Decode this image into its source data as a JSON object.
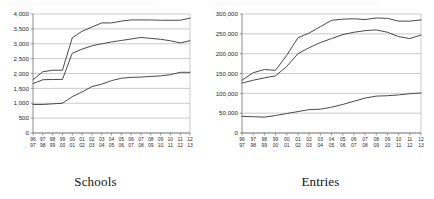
{
  "figure": {
    "panels": [
      {
        "caption": "Schools"
      },
      {
        "caption": "Entries"
      }
    ]
  },
  "chart_data": [
    {
      "type": "line",
      "title": "Schools",
      "xlabel": "",
      "ylabel": "",
      "grid": true,
      "legend": "none",
      "ylim": [
        0,
        4000
      ],
      "yticks": [
        0,
        500,
        1000,
        1500,
        2000,
        2500,
        3000,
        3500,
        4000
      ],
      "ytick_labels": [
        "0",
        "500",
        "1,000",
        "1,500",
        "2,000",
        "2,500",
        "3,000",
        "3,500",
        "4,000"
      ],
      "categories": [
        "96/97",
        "97/98",
        "98/99",
        "99/00",
        "00/01",
        "01/02",
        "02/03",
        "03/04",
        "04/05",
        "05/06",
        "06/07",
        "07/08",
        "08/09",
        "09/10",
        "10/11",
        "11/12",
        "12/13"
      ],
      "series": [
        {
          "name": "Top series",
          "values": [
            1790,
            2060,
            2110,
            2110,
            3200,
            3420,
            3560,
            3700,
            3700,
            3760,
            3800,
            3800,
            3800,
            3790,
            3790,
            3790,
            3860
          ]
        },
        {
          "name": "Middle series",
          "values": [
            1660,
            1790,
            1800,
            1800,
            2680,
            2820,
            2930,
            3000,
            3060,
            3110,
            3160,
            3210,
            3180,
            3150,
            3100,
            3030,
            3100
          ]
        },
        {
          "name": "Bottom series",
          "values": [
            960,
            960,
            980,
            1000,
            1220,
            1380,
            1560,
            1640,
            1760,
            1840,
            1870,
            1880,
            1900,
            1920,
            1960,
            2040,
            2040
          ]
        }
      ]
    },
    {
      "type": "line",
      "title": "Entries",
      "xlabel": "",
      "ylabel": "",
      "grid": true,
      "legend": "none",
      "ylim": [
        0,
        300000
      ],
      "yticks": [
        0,
        50000,
        100000,
        150000,
        200000,
        250000,
        300000
      ],
      "ytick_labels": [
        "0",
        "50,000",
        "100,000",
        "150,000",
        "200,000",
        "250,000",
        "300,000"
      ],
      "categories": [
        "96/97",
        "97/98",
        "98/99",
        "99/00",
        "00/01",
        "01/02",
        "02/03",
        "03/04",
        "04/05",
        "05/06",
        "06/07",
        "07/08",
        "08/09",
        "09/10",
        "10/11",
        "11/12",
        "12/13"
      ],
      "series": [
        {
          "name": "Top series",
          "values": [
            133000,
            152000,
            160000,
            158000,
            196000,
            240000,
            252000,
            268000,
            284000,
            287000,
            288000,
            286000,
            290000,
            289000,
            282000,
            282000,
            285000
          ]
        },
        {
          "name": "Middle series",
          "values": [
            126000,
            133000,
            139000,
            144000,
            168000,
            200000,
            215000,
            228000,
            238000,
            248000,
            254000,
            258000,
            260000,
            254000,
            243000,
            238000,
            247000
          ]
        },
        {
          "name": "Bottom series",
          "values": [
            42000,
            41000,
            40000,
            44000,
            49000,
            54000,
            59000,
            60000,
            65000,
            72000,
            80000,
            88000,
            93000,
            94000,
            96000,
            99000,
            101000
          ]
        }
      ]
    }
  ]
}
